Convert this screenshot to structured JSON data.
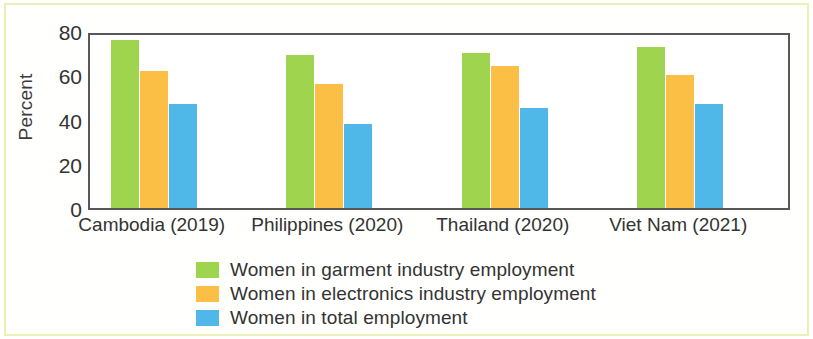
{
  "chart_data": {
    "type": "bar",
    "title": "",
    "subtitle": "",
    "xlabel": "",
    "ylabel": "Percent",
    "ylim": [
      0,
      80
    ],
    "yticks": [
      0,
      20,
      40,
      60,
      80
    ],
    "grid": false,
    "legend_position": "bottom",
    "categories": [
      "Cambodia (2019)",
      "Philippines (2020)",
      "Thailand (2020)",
      "Viet Nam (2021)"
    ],
    "series": [
      {
        "name": "Women in garment industry employment",
        "color": "#9ED44E",
        "values": [
          76,
          69,
          70,
          73
        ]
      },
      {
        "name": "Women in electronics industry employment",
        "color": "#FBBF45",
        "values": [
          62,
          56,
          64,
          60
        ]
      },
      {
        "name": "Women in total employment",
        "color": "#4FB8E8",
        "values": [
          47,
          38,
          45,
          47
        ]
      }
    ]
  },
  "axis": {
    "y_title": "Percent",
    "y_tick_labels": [
      "80",
      "60",
      "40",
      "20",
      "0"
    ]
  },
  "colors": {
    "garment_green": "#9ED44E",
    "electronics_orange": "#FBBF45",
    "total_blue": "#4FB8E8",
    "frame": "#585858",
    "text": "#333333",
    "figure_border": "#EAF0B8"
  }
}
